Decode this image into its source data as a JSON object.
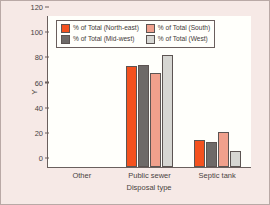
{
  "chart_data": {
    "type": "bar",
    "title": "",
    "xlabel": "Disposal type",
    "ylabel": "Y",
    "categories": [
      "Other",
      "Public sewer",
      "Septic tank"
    ],
    "series": [
      {
        "name": "% of Total (North-east)",
        "color": "#f4511e",
        "values": [
          0,
          80,
          21.5
        ]
      },
      {
        "name": "% of Total (Mid-west)",
        "color": "#6e6a68",
        "values": [
          0,
          81,
          20
        ]
      },
      {
        "name": "% of Total (South)",
        "color": "#f0a08c",
        "values": [
          0,
          74.5,
          27.5
        ]
      },
      {
        "name": "% of Total (West)",
        "color": "#d6d6d2",
        "values": [
          0,
          89,
          12.5
        ]
      }
    ],
    "ylim": [
      0,
      120
    ],
    "yticks": [
      0,
      20,
      40,
      60,
      80,
      100,
      120
    ],
    "grid": false,
    "legend_position": "upper-center"
  }
}
